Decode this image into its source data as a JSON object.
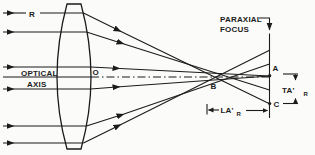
{
  "figure": {
    "description_labels_only": "optical ray diagram",
    "labels": {
      "ray": "R",
      "optical_line1": "OPTICAL",
      "optical_line2": "AXIS",
      "lens_center": "O",
      "paraxial_line1": "PARAXIAL",
      "paraxial_line2": "FOCUS",
      "point_a": "A",
      "point_b": "B",
      "point_c": "C",
      "ta": "TA'",
      "ta_sub": "R",
      "la": "LA'",
      "la_sub": "R"
    },
    "colors": {
      "ink": "#1b1b1b",
      "paper": "#fbfbfa"
    }
  }
}
